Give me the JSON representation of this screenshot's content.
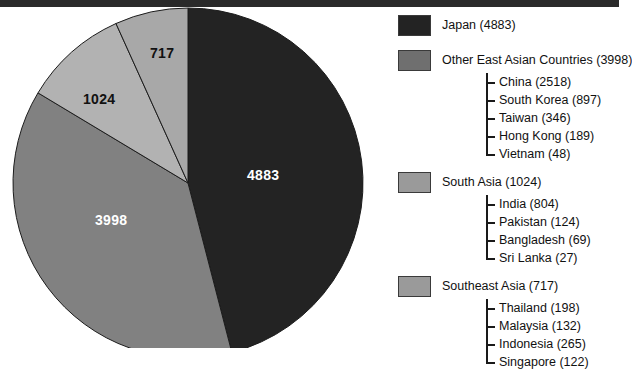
{
  "figure": {
    "type": "pie-chart-with-legend",
    "background": "#ffffff"
  },
  "chart_data": {
    "type": "pie",
    "title": "",
    "labels": [
      "Japan",
      "Other East Asian Countries",
      "South Asia",
      "Southeast Asia"
    ],
    "values": [
      4883,
      3998,
      1024,
      717
    ],
    "total": 10622,
    "slice_colors": [
      "#232323",
      "#818181",
      "#b2b2b2",
      "#a8a8a8"
    ],
    "slice_label_texts": [
      "4883",
      "3998",
      "1024",
      "717"
    ],
    "legend_position": "right",
    "start_angle_deg": 0,
    "direction": "clockwise",
    "breakdown": [
      {
        "group": "Japan",
        "value": 4883,
        "children": []
      },
      {
        "group": "Other East Asian Countries",
        "value": 3998,
        "children": [
          {
            "name": "China",
            "value": 2518
          },
          {
            "name": "South Korea",
            "value": 897
          },
          {
            "name": "Taiwan",
            "value": 346
          },
          {
            "name": "Hong Kong",
            "value": 189
          },
          {
            "name": "Vietnam",
            "value": 48
          }
        ]
      },
      {
        "group": "South Asia",
        "value": 1024,
        "children": [
          {
            "name": "India",
            "value": 804
          },
          {
            "name": "Pakistan",
            "value": 124
          },
          {
            "name": "Bangladesh",
            "value": 69
          },
          {
            "name": "Sri Lanka",
            "value": 27
          }
        ]
      },
      {
        "group": "Southeast Asia",
        "value": 717,
        "children": [
          {
            "name": "Thailand",
            "value": 198
          },
          {
            "name": "Malaysia",
            "value": 132
          },
          {
            "name": "Indonesia",
            "value": 265
          },
          {
            "name": "Singapore",
            "value": 122
          }
        ]
      }
    ]
  },
  "pie": {
    "center_x": 188,
    "center_y": 183,
    "radius": 175,
    "slice_labels": [
      {
        "text": "4883",
        "tone": "on-dark"
      },
      {
        "text": "3998",
        "tone": "on-dark"
      },
      {
        "text": "1024",
        "tone": "on-light"
      },
      {
        "text": "717",
        "tone": "on-light"
      }
    ]
  },
  "legend": {
    "groups": [
      {
        "label": "Japan (4883)",
        "color": "#232323",
        "children": []
      },
      {
        "label": "Other East Asian Countries (3998)",
        "color": "#6f6f6f",
        "children": [
          "China (2518)",
          "South Korea (897)",
          "Taiwan (346)",
          "Hong Kong (189)",
          "Vietnam (48)"
        ]
      },
      {
        "label": "South Asia (1024)",
        "color": "#9a9a9a",
        "children": [
          "India (804)",
          "Pakistan (124)",
          "Bangladesh (69)",
          "Sri Lanka (27)"
        ]
      },
      {
        "label": "Southeast Asia (717)",
        "color": "#9a9a9a",
        "children": [
          "Thailand (198)",
          "Malaysia (132)",
          "Indonesia (265)",
          "Singapore (122)"
        ]
      }
    ]
  }
}
